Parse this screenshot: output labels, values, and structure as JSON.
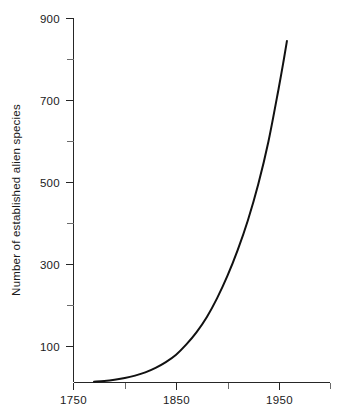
{
  "chart_data": {
    "type": "line",
    "title": "",
    "subtitle": "",
    "xlabel": "",
    "ylabel": "Number of established alien species",
    "xlim": [
      1750,
      2000
    ],
    "ylim": [
      12,
      900
    ],
    "grid": false,
    "legend": null,
    "annotations": [],
    "x_ticks_major": [
      1750,
      1850,
      1950
    ],
    "x_ticks_major_labels": [
      "1750",
      "1850",
      "1950"
    ],
    "x_ticks_minor": [
      1800,
      1900,
      2000
    ],
    "y_ticks_major": [
      100,
      300,
      500,
      700,
      900
    ],
    "y_ticks_major_labels": [
      "100",
      "300",
      "500",
      "700",
      "900"
    ],
    "y_ticks_minor": [
      200,
      400,
      600,
      800
    ],
    "series": [
      {
        "name": "Established alien species",
        "color": "#111111",
        "x": [
          1770,
          1780,
          1790,
          1800,
          1810,
          1820,
          1830,
          1840,
          1850,
          1860,
          1870,
          1880,
          1890,
          1900,
          1910,
          1920,
          1930,
          1940,
          1950,
          1955,
          1958
        ],
        "values": [
          14,
          16,
          19,
          23,
          29,
          37,
          48,
          62,
          80,
          105,
          135,
          172,
          218,
          272,
          335,
          408,
          495,
          600,
          730,
          800,
          845
        ]
      }
    ]
  },
  "axes": {
    "y_axis_title": "Number of established alien species",
    "x_axis_title": ""
  },
  "ticks": {
    "y_labels": [
      "900",
      "700",
      "500",
      "300",
      "100"
    ],
    "x_labels": [
      "1750",
      "1850",
      "1950"
    ]
  },
  "colors": {
    "curve": "#111111",
    "axis": "#262626",
    "minor_tick": "#6b6b6b",
    "background": "#ffffff",
    "text": "#1a1a1a"
  }
}
